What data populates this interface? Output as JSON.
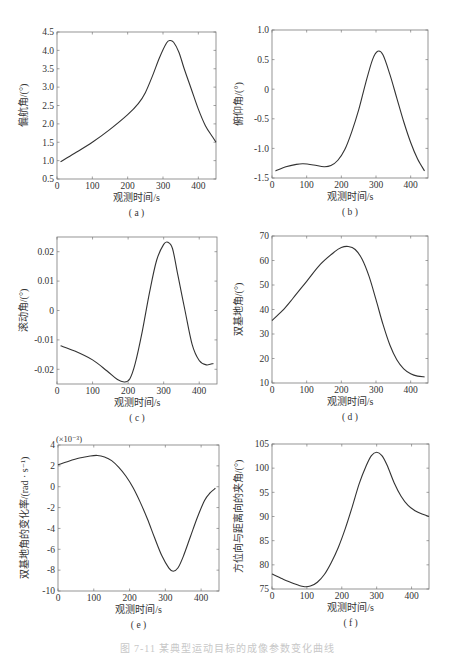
{
  "figure": {
    "caption": "图 7-11  某典型运动目标的成像参数变化曲线"
  },
  "chart_data": [
    {
      "id": "a",
      "type": "line",
      "panel_label": "( a )",
      "xlabel": "观测时间/s",
      "ylabel": "偏航角/(°)",
      "xlim": [
        0,
        450
      ],
      "ylim": [
        0.5,
        4.5
      ],
      "xticks": [
        0,
        100,
        200,
        300,
        400
      ],
      "xtick_labels": [
        "0",
        "100",
        "200",
        "300",
        "400"
      ],
      "yticks": [
        0.5,
        1.0,
        1.5,
        2.0,
        2.5,
        3.0,
        3.5,
        4.0,
        4.5
      ],
      "ytick_labels": [
        "0.5",
        "1.0",
        "1.5",
        "2.0",
        "2.5",
        "3.0",
        "3.5",
        "4.0",
        "4.5"
      ],
      "grid": false,
      "x": [
        10,
        50,
        100,
        150,
        200,
        230,
        250,
        270,
        290,
        310,
        320,
        330,
        345,
        360,
        380,
        400,
        420,
        440,
        450
      ],
      "y": [
        0.97,
        1.2,
        1.5,
        1.85,
        2.25,
        2.55,
        2.85,
        3.3,
        3.8,
        4.2,
        4.27,
        4.22,
        3.95,
        3.5,
        2.95,
        2.4,
        1.95,
        1.65,
        1.5
      ]
    },
    {
      "id": "b",
      "type": "line",
      "panel_label": "( b )",
      "xlabel": "观测时间/s",
      "ylabel": "俯仰角/(°)",
      "xlim": [
        0,
        450
      ],
      "ylim": [
        -1.5,
        1.0
      ],
      "xticks": [
        0,
        100,
        200,
        300,
        400
      ],
      "xtick_labels": [
        "0",
        "100",
        "200",
        "300",
        "400"
      ],
      "yticks": [
        -1.5,
        -1.0,
        -0.5,
        0,
        0.5,
        1.0
      ],
      "ytick_labels": [
        "-1.5",
        "-1.0",
        "-0.5",
        "0",
        "0.5",
        "1.0"
      ],
      "grid": false,
      "x": [
        10,
        40,
        70,
        90,
        120,
        150,
        170,
        190,
        210,
        230,
        250,
        270,
        290,
        305,
        320,
        340,
        360,
        380,
        400,
        420,
        440
      ],
      "y": [
        -1.38,
        -1.31,
        -1.27,
        -1.26,
        -1.28,
        -1.31,
        -1.29,
        -1.2,
        -1.02,
        -0.72,
        -0.35,
        0.1,
        0.5,
        0.64,
        0.58,
        0.25,
        -0.15,
        -0.55,
        -0.9,
        -1.18,
        -1.38
      ]
    },
    {
      "id": "c",
      "type": "line",
      "panel_label": "( c )",
      "xlabel": "观测时间/s",
      "ylabel": "滚动角/(°)",
      "xlim": [
        0,
        450
      ],
      "ylim": [
        -0.025,
        0.025
      ],
      "xticks": [
        0,
        100,
        200,
        300,
        400
      ],
      "xtick_labels": [
        "0",
        "100",
        "200",
        "300",
        "400"
      ],
      "yticks": [
        -0.02,
        -0.01,
        0,
        0.01,
        0.02
      ],
      "ytick_labels": [
        "-0.02",
        "-0.01",
        "0",
        "0.01",
        "0.02"
      ],
      "grid": false,
      "x": [
        10,
        50,
        100,
        140,
        170,
        190,
        205,
        220,
        240,
        260,
        280,
        300,
        312,
        325,
        340,
        360,
        380,
        400,
        420,
        440
      ],
      "y": [
        -0.012,
        -0.0138,
        -0.0168,
        -0.0205,
        -0.0235,
        -0.0243,
        -0.0232,
        -0.018,
        -0.007,
        0.006,
        0.017,
        0.0225,
        0.0232,
        0.021,
        0.012,
        0.0,
        -0.0115,
        -0.017,
        -0.0185,
        -0.018
      ]
    },
    {
      "id": "d",
      "type": "line",
      "panel_label": "( d )",
      "xlabel": "观测时间/s",
      "ylabel": "双基地角/(°)",
      "xlim": [
        0,
        450
      ],
      "ylim": [
        10,
        70
      ],
      "xticks": [
        0,
        100,
        200,
        300,
        400
      ],
      "xtick_labels": [
        "0",
        "100",
        "200",
        "300",
        "400"
      ],
      "yticks": [
        10,
        20,
        30,
        40,
        50,
        60,
        70
      ],
      "ytick_labels": [
        "10",
        "20",
        "30",
        "40",
        "50",
        "60",
        "70"
      ],
      "grid": false,
      "x": [
        0,
        30,
        60,
        100,
        140,
        180,
        200,
        220,
        240,
        260,
        280,
        300,
        320,
        340,
        360,
        380,
        400,
        420,
        440
      ],
      "y": [
        35.5,
        39.5,
        44.5,
        51.5,
        58.5,
        63.5,
        65.3,
        65.7,
        64.5,
        60.5,
        53.5,
        44,
        34,
        25.5,
        19.5,
        15.8,
        13.8,
        12.8,
        12.5
      ]
    },
    {
      "id": "e",
      "type": "line",
      "panel_label": "( e )",
      "xlabel": "观测时间/s",
      "ylabel": "双基地角的变化率/(rad · s⁻¹)",
      "y_multiplier": "(×10⁻³)",
      "xlim": [
        0,
        450
      ],
      "ylim": [
        -10,
        4
      ],
      "xticks": [
        0,
        100,
        200,
        300,
        400
      ],
      "xtick_labels": [
        "0",
        "100",
        "200",
        "300",
        "400"
      ],
      "yticks": [
        -10,
        -8,
        -6,
        -4,
        -2,
        0,
        2,
        4
      ],
      "ytick_labels": [
        "-10",
        "-8",
        "-6",
        "-4",
        "-2",
        "0",
        "2",
        "4"
      ],
      "grid": false,
      "x": [
        0,
        30,
        60,
        90,
        110,
        130,
        150,
        170,
        190,
        210,
        230,
        250,
        270,
        290,
        310,
        322,
        335,
        350,
        370,
        390,
        410,
        425,
        440
      ],
      "y": [
        2.1,
        2.45,
        2.75,
        2.95,
        3.0,
        2.85,
        2.5,
        1.85,
        1.0,
        -0.1,
        -1.5,
        -3.1,
        -4.9,
        -6.6,
        -7.8,
        -8.1,
        -7.8,
        -6.7,
        -4.8,
        -2.9,
        -1.3,
        -0.6,
        -0.15
      ]
    },
    {
      "id": "f",
      "type": "line",
      "panel_label": "( f )",
      "xlabel": "观测时间/s",
      "ylabel": "方位向与距离向的夹角/(°)",
      "xlim": [
        0,
        450
      ],
      "ylim": [
        75,
        105
      ],
      "xticks": [
        0,
        100,
        200,
        300,
        400
      ],
      "xtick_labels": [
        "0",
        "100",
        "200",
        "300",
        "400"
      ],
      "yticks": [
        75,
        80,
        85,
        90,
        95,
        100,
        105
      ],
      "ytick_labels": [
        "75",
        "80",
        "85",
        "90",
        "95",
        "100",
        "105"
      ],
      "grid": false,
      "x": [
        0,
        30,
        60,
        90,
        110,
        130,
        150,
        170,
        190,
        210,
        230,
        250,
        270,
        285,
        300,
        315,
        330,
        350,
        370,
        390,
        410,
        430,
        450
      ],
      "y": [
        78.1,
        77.1,
        76.2,
        75.5,
        75.6,
        76.4,
        78.0,
        80.5,
        83.6,
        87.5,
        92.0,
        96.8,
        100.5,
        102.6,
        103.3,
        102.6,
        100.6,
        97.0,
        94.2,
        92.3,
        91.2,
        90.5,
        90.0
      ]
    }
  ],
  "panels": [
    {
      "id": "a",
      "frame": {
        "x": 57,
        "y": 32,
        "w": 159,
        "h": 147
      }
    },
    {
      "id": "b",
      "frame": {
        "x": 272,
        "y": 30,
        "w": 156,
        "h": 148
      }
    },
    {
      "id": "c",
      "frame": {
        "x": 57,
        "y": 237,
        "w": 160,
        "h": 147
      }
    },
    {
      "id": "d",
      "frame": {
        "x": 272,
        "y": 236,
        "w": 156,
        "h": 147
      }
    },
    {
      "id": "e",
      "frame": {
        "x": 58,
        "y": 445,
        "w": 161,
        "h": 146
      }
    },
    {
      "id": "f",
      "frame": {
        "x": 272,
        "y": 444,
        "w": 157,
        "h": 145
      }
    }
  ],
  "colors": {
    "line": "#333333",
    "axis": "#7a7a7a",
    "text": "#333333"
  }
}
